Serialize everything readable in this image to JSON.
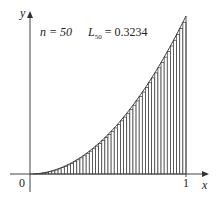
{
  "chart_data": {
    "type": "bar",
    "title": "n = 50   L50 = 0.3234",
    "function": "y = x^2",
    "n": 50,
    "approximation": "left endpoint sum",
    "L50": 0.3234,
    "xlabel": "x",
    "ylabel": "y",
    "x_ticks": [
      "0",
      "1"
    ],
    "xlim": [
      0,
      1
    ],
    "ylim": [
      0,
      1
    ],
    "grid": false,
    "legend": null
  },
  "labels": {
    "n_text": "n = 50",
    "L_main": "L",
    "L_sub": "50",
    "L_value": " = 0.3234",
    "x_axis": "x",
    "y_axis": "y",
    "origin": "0",
    "one": "1"
  },
  "colors": {
    "line": "#333333",
    "axis": "#444444"
  }
}
